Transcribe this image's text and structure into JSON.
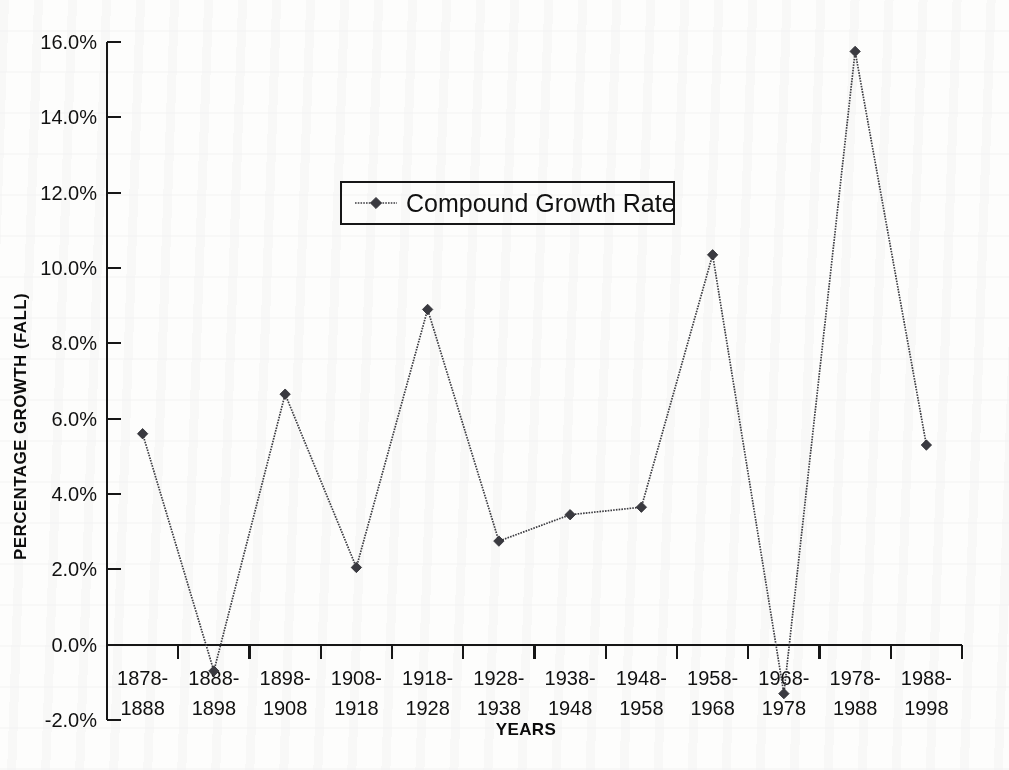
{
  "chart_data": {
    "type": "line",
    "title": "",
    "xlabel": "YEARS",
    "ylabel": "PERCENTAGE GROWTH (FALL)",
    "categories": [
      "1878-\n1888",
      "1888-\n1898",
      "1898-\n1908",
      "1908-\n1918",
      "1918-\n1928",
      "1928-\n1938",
      "1938-\n1948",
      "1948-\n1958",
      "1958-\n1968",
      "1968-\n1978",
      "1978-\n1988",
      "1988-\n1998"
    ],
    "category_lines": [
      [
        "1878-",
        "1888"
      ],
      [
        "1888-",
        "1898"
      ],
      [
        "1898-",
        "1908"
      ],
      [
        "1908-",
        "1918"
      ],
      [
        "1918-",
        "1928"
      ],
      [
        "1928-",
        "1938"
      ],
      [
        "1938-",
        "1948"
      ],
      [
        "1948-",
        "1958"
      ],
      [
        "1958-",
        "1968"
      ],
      [
        "1968-",
        "1978"
      ],
      [
        "1978-",
        "1988"
      ],
      [
        "1988-",
        "1998"
      ]
    ],
    "series": [
      {
        "name": "Compound Growth Rate",
        "values": [
          5.6,
          -0.7,
          6.65,
          2.05,
          8.9,
          2.75,
          3.45,
          3.65,
          10.35,
          -1.3,
          15.75,
          5.3
        ]
      }
    ],
    "ylim": [
      -2.0,
      16.0
    ],
    "ytick_values": [
      -2.0,
      0.0,
      2.0,
      4.0,
      6.0,
      8.0,
      10.0,
      12.0,
      14.0,
      16.0
    ],
    "ytick_labels": [
      "-2.0%",
      "0.0%",
      "2.0%",
      "4.0%",
      "6.0%",
      "8.0%",
      "10.0%",
      "12.0%",
      "14.0%",
      "16.0%"
    ],
    "grid": false,
    "legend_position": "upper-center-inside",
    "marker": "diamond",
    "line_style": "dotted",
    "colors": {
      "series": "#3d3d42",
      "axis": "#161616",
      "background": "#fdfdfc",
      "text": "#111111"
    }
  },
  "legend": {
    "entries": [
      {
        "label": "Compound Growth Rate",
        "marker": "diamond-marker"
      }
    ]
  }
}
